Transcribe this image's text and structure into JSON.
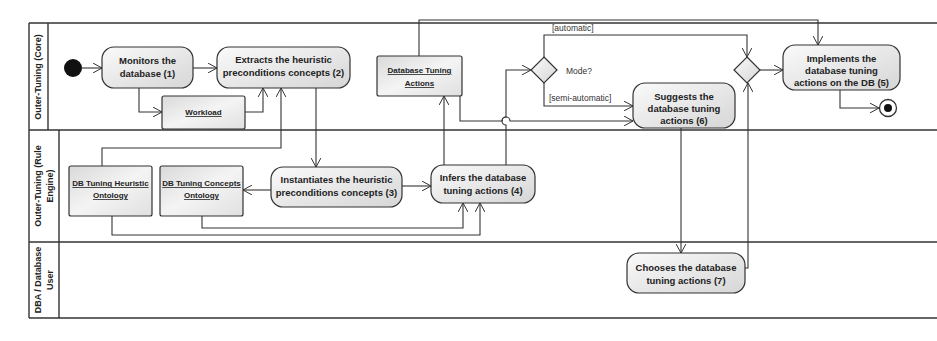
{
  "diagram": {
    "type": "UML activity diagram",
    "colors": {
      "node_fill_top": "#f7f7f7",
      "node_fill_bottom": "#d8d8d8",
      "stroke": "#333333",
      "background": "#ffffff"
    },
    "lanes": [
      {
        "id": "core",
        "label": "Outer-Tuning (Core)"
      },
      {
        "id": "rule_engine",
        "label_line1": "Outer-Tuning (Rule",
        "label_line2": "Engine)"
      },
      {
        "id": "dba",
        "label_line1": "DBA / Database",
        "label_line2": "User"
      }
    ],
    "start_node": {
      "label": "initial-node"
    },
    "final_node": {
      "label": "final-node"
    },
    "actions": {
      "a1": {
        "line1": "Monitors the",
        "line2": "database (1)"
      },
      "a2": {
        "line1": "Extracts the heuristic",
        "line2": "preconditions concepts (2)"
      },
      "a3": {
        "line1": "Instantiates the heuristic",
        "line2": "preconditions concepts (3)"
      },
      "a4": {
        "line1": "Infers the database",
        "line2": "tuning actions (4)"
      },
      "a5": {
        "line1": "Implements the",
        "line2": "database tuning",
        "line3": "actions on the DB (5)"
      },
      "a6": {
        "line1": "Suggests the",
        "line2": "database tuning",
        "line3": "actions (6)"
      },
      "a7": {
        "line1": "Chooses the database",
        "line2": "tuning actions (7)"
      }
    },
    "objects": {
      "workload": {
        "line1": "Workload"
      },
      "db_tuning_actions": {
        "line1": "Database Tuning",
        "line2": "Actions"
      },
      "heuristic_ontology": {
        "line1": "DB Tuning Heuristic",
        "line2": "Ontology"
      },
      "concepts_ontology": {
        "line1": "DB Tuning Concepts",
        "line2": "Ontology"
      }
    },
    "decision": {
      "label": "Mode?"
    },
    "guards": {
      "automatic": "[automatic]",
      "semi_automatic": "[semi-automatic]"
    }
  }
}
